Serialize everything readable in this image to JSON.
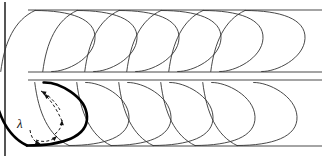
{
  "figure": {
    "canvas": {
      "width": 333,
      "height": 158
    },
    "background_color": "#ffffff",
    "line_color": "#4a4a4a",
    "curve_color": "#333333",
    "highlight_color": "#000000",
    "arrow_color": "#1a1a1a"
  },
  "annotations": {
    "wavelength_label": "λ",
    "wavelength_label_x": 17,
    "wavelength_label_y": 128
  },
  "chart_data": {
    "type": "diagram",
    "title": "",
    "xlabel": "",
    "ylabel": "",
    "bands": [
      {
        "name": "upper-band",
        "top_y": 10,
        "bottom_y": 72,
        "orientation": "tails-down-left",
        "loop_count": 6,
        "loop_spacing": 42,
        "first_loop_x": 33,
        "loop_width": 62,
        "loop_values": [
          33,
          75,
          117,
          159,
          201,
          243
        ]
      },
      {
        "name": "lower-band",
        "top_y": 82,
        "bottom_y": 146,
        "orientation": "tails-up-left",
        "loop_count": 6,
        "loop_spacing": 42,
        "first_loop_x": 25,
        "loop_width": 62,
        "loop_values": [
          25,
          67,
          109,
          151,
          193,
          235
        ]
      }
    ],
    "guide_lines": [
      {
        "name": "upper-band-top",
        "y": 10,
        "x_start": 28,
        "x_end": 322
      },
      {
        "name": "upper-band-bottom",
        "y": 72,
        "x_start": 28,
        "x_end": 322
      },
      {
        "name": "lower-band-top",
        "y": 80,
        "x_start": 28,
        "x_end": 322
      },
      {
        "name": "lower-band-bottom",
        "y": 146,
        "x_start": 28,
        "x_end": 322
      }
    ],
    "frame_edges": [
      {
        "name": "left-edge",
        "x": 5,
        "y_start": 2,
        "y_end": 156
      }
    ],
    "highlighted_loop": {
      "name": "leading-vortex-loop",
      "band": "lower-band",
      "x": 25,
      "circulation_direction": "counterclockwise",
      "arrow_count": 5
    }
  }
}
